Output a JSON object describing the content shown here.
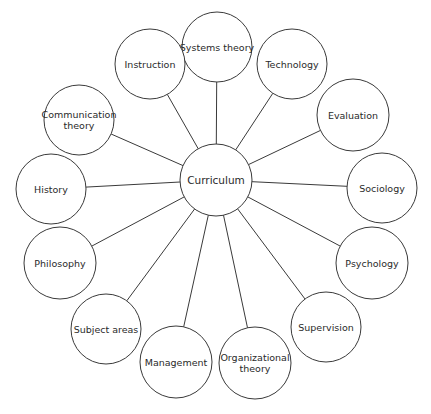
{
  "diagram": {
    "type": "hub-and-spoke",
    "center": {
      "label": "Curriculum",
      "cx": 216,
      "cy": 180,
      "r": 36
    },
    "nodes": [
      {
        "id": "systems-theory",
        "lines": [
          "Systems theory"
        ],
        "cx": 217,
        "cy": 47,
        "r": 35
      },
      {
        "id": "technology",
        "lines": [
          "Technology"
        ],
        "cx": 292,
        "cy": 64,
        "r": 35
      },
      {
        "id": "evaluation",
        "lines": [
          "Evaluation"
        ],
        "cx": 353,
        "cy": 115,
        "r": 36
      },
      {
        "id": "sociology",
        "lines": [
          "Sociology"
        ],
        "cx": 382,
        "cy": 188,
        "r": 35
      },
      {
        "id": "psychology",
        "lines": [
          "Psychology"
        ],
        "cx": 372,
        "cy": 263,
        "r": 36
      },
      {
        "id": "supervision",
        "lines": [
          "Supervision"
        ],
        "cx": 326,
        "cy": 327,
        "r": 35
      },
      {
        "id": "organizational-theory",
        "lines": [
          "Organizational",
          "theory"
        ],
        "cx": 255,
        "cy": 363,
        "r": 36
      },
      {
        "id": "management",
        "lines": [
          "Management"
        ],
        "cx": 176,
        "cy": 362,
        "r": 36
      },
      {
        "id": "subject-areas",
        "lines": [
          "Subject areas"
        ],
        "cx": 106,
        "cy": 329,
        "r": 35
      },
      {
        "id": "philosophy",
        "lines": [
          "Philosophy"
        ],
        "cx": 60,
        "cy": 263,
        "r": 36
      },
      {
        "id": "history",
        "lines": [
          "History"
        ],
        "cx": 51,
        "cy": 189,
        "r": 35
      },
      {
        "id": "communication-theory",
        "lines": [
          "Communication",
          "theory"
        ],
        "cx": 79,
        "cy": 120,
        "r": 35
      },
      {
        "id": "instruction",
        "lines": [
          "Instruction"
        ],
        "cx": 150,
        "cy": 64,
        "r": 35
      }
    ],
    "colors": {
      "stroke": "#3a3a3a",
      "text": "#2a2a2a",
      "background": "#ffffff"
    }
  }
}
